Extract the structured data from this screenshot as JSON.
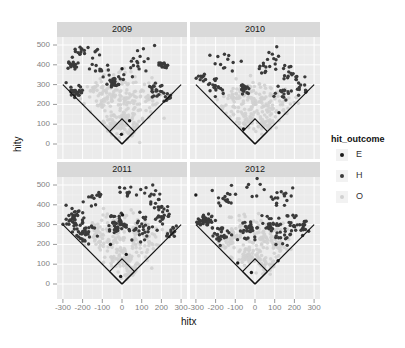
{
  "chart_data": {
    "type": "scatter",
    "layout": "facet_wrap 2x2",
    "xlabel": "hitx",
    "ylabel": "hity",
    "xlim": [
      -320,
      320
    ],
    "ylim": [
      -35,
      550
    ],
    "x_ticks": [
      -300,
      -200,
      -100,
      0,
      100,
      200,
      300
    ],
    "x_tick_labels": [
      "-300",
      "-200",
      "-100",
      "0",
      "100",
      "200",
      "300"
    ],
    "y_ticks": [
      0,
      100,
      200,
      300,
      400,
      500
    ],
    "y_tick_labels": [
      "0",
      "100",
      "200",
      "300",
      "400",
      "500"
    ],
    "grid": true,
    "legend": {
      "title": "hit_outcome",
      "position": "right",
      "entries": [
        {
          "label": "E",
          "color": "#1a1a1a"
        },
        {
          "label": "H",
          "color": "#3a3a3a"
        },
        {
          "label": "O",
          "color": "#d0d0d0"
        }
      ]
    },
    "facets": [
      {
        "label": "2009"
      },
      {
        "label": "2010"
      },
      {
        "label": "2011"
      },
      {
        "label": "2012"
      }
    ],
    "field_overlay": {
      "foul_lines": [
        [
          [
            0,
            0
          ],
          [
            -300,
            300
          ]
        ],
        [
          [
            0,
            0
          ],
          [
            300,
            300
          ]
        ]
      ],
      "infield_diamond": [
        [
          0,
          0
        ],
        [
          63,
          63
        ],
        [
          0,
          127
        ],
        [
          -63,
          63
        ],
        [
          0,
          0
        ]
      ]
    },
    "clusters": {
      "2009": {
        "H": [
          [
            -210,
            470,
            25,
            12
          ],
          [
            -250,
            400,
            30,
            18
          ],
          [
            -240,
            260,
            35,
            25
          ],
          [
            -40,
            310,
            25,
            30
          ],
          [
            200,
            400,
            20,
            15
          ],
          [
            170,
            270,
            35,
            20
          ],
          [
            230,
            230,
            15,
            10
          ],
          [
            -150,
            420,
            60,
            10
          ],
          [
            100,
            430,
            80,
            10
          ],
          [
            -80,
            350,
            40,
            8
          ],
          [
            60,
            360,
            60,
            8
          ]
        ],
        "O": [
          [
            -100,
            250,
            80,
            30
          ],
          [
            0,
            250,
            100,
            40
          ],
          [
            100,
            220,
            90,
            30
          ],
          [
            0,
            120,
            60,
            40
          ],
          [
            50,
            60,
            40,
            20
          ],
          [
            -50,
            80,
            40,
            15
          ]
        ],
        "E": [
          [
            -10,
            40,
            10,
            1
          ],
          [
            40,
            120,
            5,
            1
          ],
          [
            0,
            380,
            1,
            1
          ]
        ]
      },
      "2010": {
        "H": [
          [
            -270,
            340,
            20,
            10
          ],
          [
            -200,
            280,
            30,
            18
          ],
          [
            -50,
            280,
            20,
            18
          ],
          [
            50,
            370,
            40,
            8
          ],
          [
            140,
            260,
            30,
            15
          ],
          [
            200,
            350,
            40,
            15
          ],
          [
            -150,
            420,
            60,
            12
          ],
          [
            100,
            420,
            60,
            12
          ],
          [
            240,
            280,
            30,
            10
          ]
        ],
        "O": [
          [
            -100,
            230,
            70,
            30
          ],
          [
            0,
            220,
            100,
            40
          ],
          [
            100,
            200,
            80,
            30
          ],
          [
            -40,
            120,
            40,
            20
          ],
          [
            50,
            100,
            40,
            20
          ]
        ],
        "E": [
          [
            120,
            160,
            3,
            1
          ],
          [
            -60,
            80,
            5,
            1
          ]
        ]
      },
      "2011": {
        "H": [
          [
            -240,
            330,
            40,
            40
          ],
          [
            -180,
            240,
            50,
            30
          ],
          [
            -30,
            300,
            40,
            40
          ],
          [
            100,
            280,
            60,
            30
          ],
          [
            200,
            360,
            40,
            25
          ],
          [
            -150,
            440,
            50,
            12
          ],
          [
            30,
            480,
            40,
            10
          ],
          [
            160,
            430,
            50,
            12
          ],
          [
            250,
            260,
            30,
            12
          ]
        ],
        "O": [
          [
            -100,
            240,
            80,
            30
          ],
          [
            0,
            250,
            100,
            40
          ],
          [
            100,
            220,
            80,
            30
          ],
          [
            0,
            120,
            50,
            30
          ],
          [
            50,
            50,
            30,
            20
          ]
        ],
        "E": [
          [
            -60,
            200,
            3,
            1
          ],
          [
            20,
            150,
            4,
            1
          ],
          [
            -10,
            40,
            3,
            1
          ],
          [
            0,
            350,
            3,
            1
          ]
        ]
      },
      "2012": {
        "H": [
          [
            -250,
            310,
            30,
            40
          ],
          [
            -170,
            250,
            40,
            25
          ],
          [
            -30,
            270,
            40,
            25
          ],
          [
            80,
            300,
            50,
            25
          ],
          [
            150,
            240,
            40,
            15
          ],
          [
            200,
            310,
            40,
            20
          ],
          [
            -150,
            430,
            50,
            15
          ],
          [
            0,
            490,
            60,
            8
          ],
          [
            130,
            440,
            50,
            15
          ],
          [
            250,
            290,
            20,
            10
          ]
        ],
        "O": [
          [
            -100,
            240,
            70,
            30
          ],
          [
            0,
            240,
            100,
            40
          ],
          [
            100,
            220,
            70,
            30
          ],
          [
            -30,
            130,
            40,
            25
          ],
          [
            60,
            90,
            40,
            25
          ]
        ],
        "E": [
          [
            -90,
            110,
            3,
            1
          ],
          [
            -300,
            450,
            1,
            1
          ],
          [
            120,
            120,
            3,
            1
          ],
          [
            -20,
            60,
            3,
            1
          ]
        ]
      }
    },
    "colors": {
      "panel_bg": "#ebebeb",
      "grid_major": "#ffffff",
      "strip_bg": "#d9d9d9",
      "field_line": "#111111"
    }
  }
}
